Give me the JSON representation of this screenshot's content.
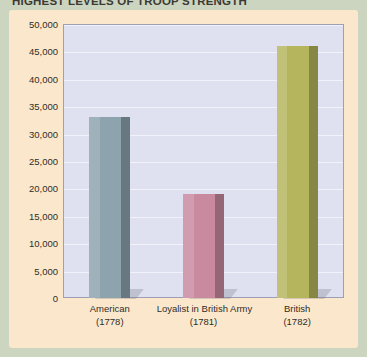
{
  "chart_data": {
    "type": "bar",
    "title": "HIGHEST LEVELS OF TROOP STRENGTH",
    "xlabel": "",
    "ylabel": "",
    "categories": [
      "American",
      "Loyalist in British Army",
      "British"
    ],
    "category_years": [
      "(1778)",
      "(1781)",
      "(1782)"
    ],
    "values": [
      33000,
      19000,
      46000
    ],
    "ylim": [
      0,
      50000
    ],
    "ytick_labels": [
      "50,000",
      "45,000",
      "40,000",
      "35,000",
      "30,000",
      "25,000",
      "20,000",
      "15,000",
      "10,000",
      "5,000",
      "0"
    ],
    "ytick_values": [
      50000,
      45000,
      40000,
      35000,
      30000,
      25000,
      20000,
      15000,
      10000,
      5000,
      0
    ],
    "grid": true,
    "legend": "none",
    "bar_colors": [
      "#8da3ad",
      "#c98aa0",
      "#b5b55e"
    ],
    "plot_background": "#dfe0f0",
    "panel_background": "#fbe8cc",
    "page_background": "#ccd5c0",
    "gridline_color": "#f2f3fa",
    "axis_color": "#9e9fb4",
    "title_color": "#3c3a34"
  }
}
